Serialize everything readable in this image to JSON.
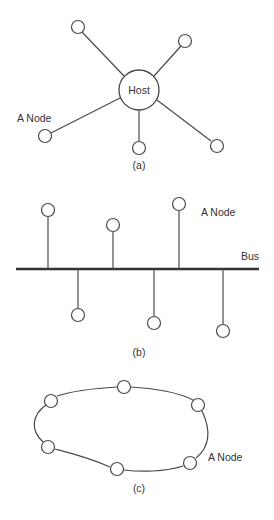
{
  "colors": {
    "stroke": "#4a4a4a",
    "bus": "#333333",
    "text": "#333333",
    "background": "#ffffff"
  },
  "star": {
    "caption": "(a)",
    "host_label": "Host",
    "node_label": "A Node",
    "host": {
      "cx": 139,
      "cy": 90,
      "r": 20
    },
    "nodes": [
      {
        "cx": 78,
        "cy": 27
      },
      {
        "cx": 185,
        "cy": 41
      },
      {
        "cx": 45,
        "cy": 136
      },
      {
        "cx": 139,
        "cy": 148
      },
      {
        "cx": 217,
        "cy": 146
      }
    ]
  },
  "bus": {
    "caption": "(b)",
    "bus_label": "Bus",
    "node_label": "A Node",
    "line": {
      "x1": 16,
      "x2": 259,
      "y": 269
    },
    "nodes": [
      {
        "x": 48,
        "cy": 210,
        "side": "top"
      },
      {
        "x": 78,
        "cy": 315,
        "side": "bottom"
      },
      {
        "x": 113,
        "cy": 225,
        "side": "top"
      },
      {
        "x": 154,
        "cy": 323,
        "side": "bottom"
      },
      {
        "x": 179,
        "cy": 204,
        "side": "top"
      },
      {
        "x": 223,
        "cy": 331,
        "side": "bottom"
      }
    ]
  },
  "ring": {
    "caption": "(c)",
    "node_label": "A Node",
    "nodes": [
      {
        "cx": 124,
        "cy": 387
      },
      {
        "cx": 198,
        "cy": 405
      },
      {
        "cx": 190,
        "cy": 463
      },
      {
        "cx": 117,
        "cy": 469
      },
      {
        "cx": 48,
        "cy": 447
      },
      {
        "cx": 51,
        "cy": 401
      }
    ]
  }
}
